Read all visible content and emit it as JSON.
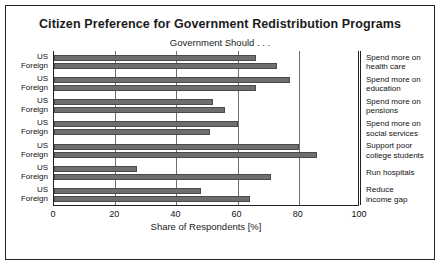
{
  "chart": {
    "title": "Citizen Preference for Government Redistribution Programs",
    "subtitle": "Government Should . . ."
  },
  "chart_data": {
    "type": "bar",
    "orientation": "horizontal",
    "title": "Citizen Preference for Government Redistribution Programs",
    "subtitle": "Government Should . . .",
    "xlabel": "Share of Respondents [%]",
    "ylabel": "",
    "xlim": [
      0,
      100
    ],
    "xticks": [
      0,
      20,
      40,
      60,
      80,
      100
    ],
    "grid": true,
    "legend": "none",
    "group_labels": [
      "US",
      "Foreign"
    ],
    "categories": [
      "Spend more on health care",
      "Spend more on education",
      "Spend more on pensions",
      "Spend more on social services",
      "Support poor college students",
      "Run hospitals",
      "Reduce income gap"
    ],
    "series": [
      {
        "name": "US",
        "values": [
          66,
          77,
          52,
          60,
          80,
          27,
          48
        ]
      },
      {
        "name": "Foreign",
        "values": [
          73,
          66,
          56,
          51,
          86,
          71,
          64
        ]
      }
    ]
  },
  "axis": {
    "ticks": [
      "0",
      "20",
      "40",
      "60",
      "80",
      "100"
    ],
    "xtitle": "Share of Respondents [%]"
  },
  "group_names": {
    "us": "US",
    "foreign": "Foreign"
  },
  "right_labels": [
    "Spend more on\nhealth care",
    "Spend more on\neducation",
    "Spend more on\npensions",
    "Spend more on\nsocial services",
    "Support poor\ncollege students",
    "Run hospitals",
    "Reduce\nincome gap"
  ]
}
